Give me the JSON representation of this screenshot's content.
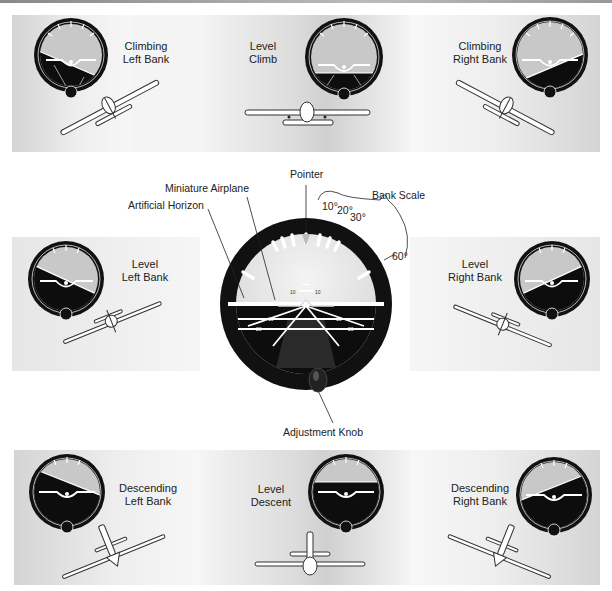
{
  "figure": {
    "panels": [
      {
        "id": "climbing-left-bank",
        "line1": "Climbing",
        "line2": "Left Bank",
        "bank_deg": -25,
        "pitch": "up"
      },
      {
        "id": "level-climb",
        "line1": "Level",
        "line2": "Climb",
        "bank_deg": 0,
        "pitch": "up"
      },
      {
        "id": "climbing-right-bank",
        "line1": "Climbing",
        "line2": "Right Bank",
        "bank_deg": 25,
        "pitch": "up"
      },
      {
        "id": "level-left-bank",
        "line1": "Level",
        "line2": "Left Bank",
        "bank_deg": -25,
        "pitch": "level"
      },
      {
        "id": "level-right-bank",
        "line1": "Level",
        "line2": "Right Bank",
        "bank_deg": 25,
        "pitch": "level"
      },
      {
        "id": "descending-left-bank",
        "line1": "Descending",
        "line2": "Left Bank",
        "bank_deg": -25,
        "pitch": "down"
      },
      {
        "id": "level-descent",
        "line1": "Level",
        "line2": "Descent",
        "bank_deg": 0,
        "pitch": "down"
      },
      {
        "id": "descending-right-bank",
        "line1": "Descending",
        "line2": "Right Bank",
        "bank_deg": 25,
        "pitch": "down"
      }
    ],
    "center_instrument": {
      "callouts": {
        "pointer": "Pointer",
        "miniature_airplane": "Miniature Airplane",
        "artificial_horizon": "Artificial Horizon",
        "bank_scale": "Bank Scale",
        "adjustment_knob": "Adjustment Knob"
      },
      "bank_marks": [
        "10°",
        "20°",
        "30°",
        "60°"
      ],
      "pitch_marks": {
        "up": "10",
        "down1": "10",
        "down2": "20"
      }
    },
    "colors": {
      "instrument_black": "#111111",
      "sky": "#e8e8e8",
      "sky_small": "#c8c8c8",
      "ground": "#0d0d0d",
      "marking_white": "#ffffff"
    }
  }
}
